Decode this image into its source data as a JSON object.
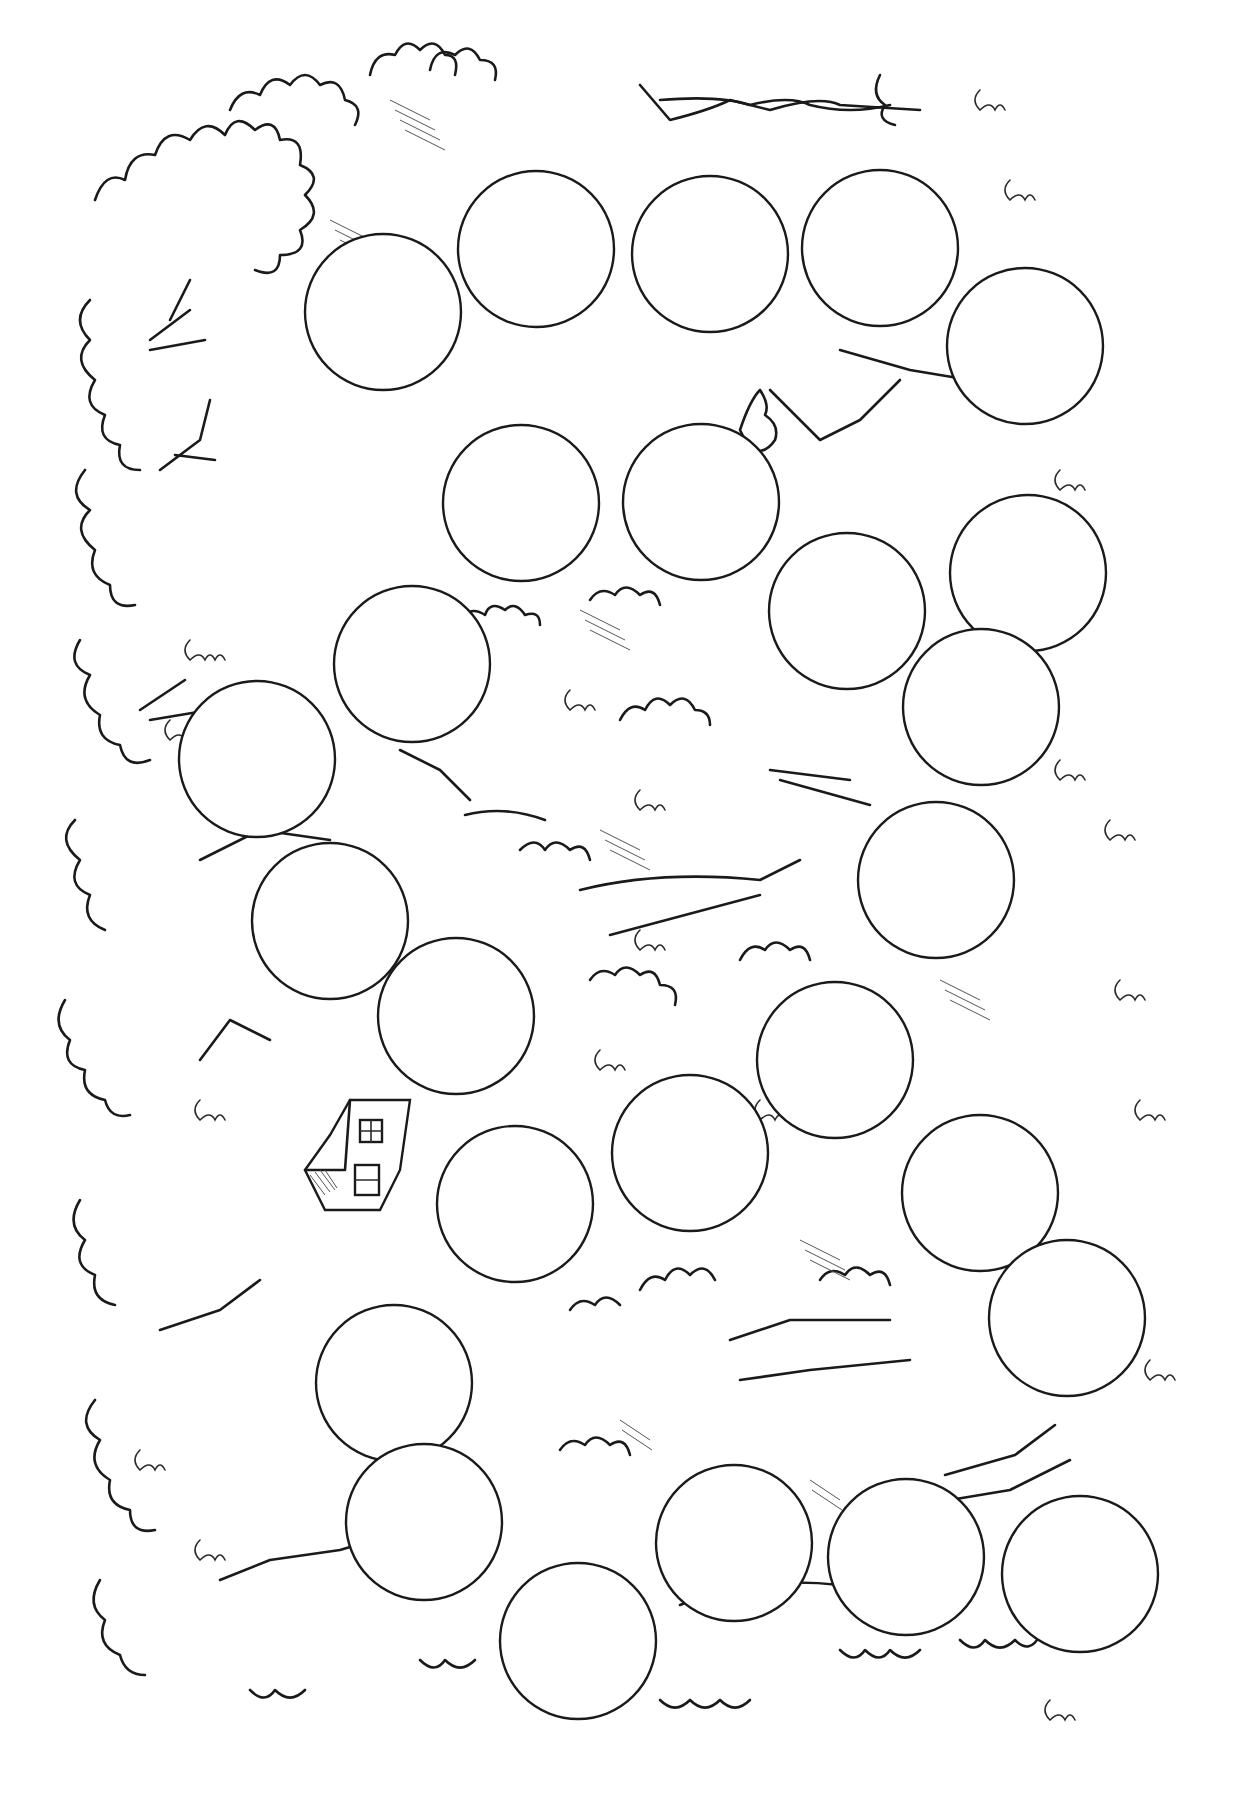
{
  "page": {
    "type": "board-game-coloring-page",
    "scene": "forest",
    "background_color": "#ffffff",
    "ink_color": "#1a1a1a"
  },
  "board": {
    "space_count": 26,
    "space_radius": 78,
    "spaces": [
      {
        "id": 1,
        "cx": 383,
        "cy": 312
      },
      {
        "id": 2,
        "cx": 536,
        "cy": 249
      },
      {
        "id": 3,
        "cx": 710,
        "cy": 254
      },
      {
        "id": 4,
        "cx": 880,
        "cy": 248
      },
      {
        "id": 5,
        "cx": 1025,
        "cy": 346
      },
      {
        "id": 6,
        "cx": 521,
        "cy": 503
      },
      {
        "id": 7,
        "cx": 701,
        "cy": 502
      },
      {
        "id": 8,
        "cx": 847,
        "cy": 611
      },
      {
        "id": 9,
        "cx": 1028,
        "cy": 573
      },
      {
        "id": 10,
        "cx": 412,
        "cy": 664
      },
      {
        "id": 11,
        "cx": 257,
        "cy": 759
      },
      {
        "id": 12,
        "cx": 981,
        "cy": 707
      },
      {
        "id": 13,
        "cx": 330,
        "cy": 921
      },
      {
        "id": 14,
        "cx": 936,
        "cy": 880
      },
      {
        "id": 15,
        "cx": 456,
        "cy": 1016
      },
      {
        "id": 16,
        "cx": 835,
        "cy": 1060
      },
      {
        "id": 17,
        "cx": 690,
        "cy": 1153
      },
      {
        "id": 18,
        "cx": 980,
        "cy": 1193
      },
      {
        "id": 19,
        "cx": 515,
        "cy": 1204
      },
      {
        "id": 20,
        "cx": 394,
        "cy": 1383
      },
      {
        "id": 21,
        "cx": 1067,
        "cy": 1318
      },
      {
        "id": 22,
        "cx": 424,
        "cy": 1522
      },
      {
        "id": 23,
        "cx": 734,
        "cy": 1543
      },
      {
        "id": 24,
        "cx": 906,
        "cy": 1557
      },
      {
        "id": 25,
        "cx": 1080,
        "cy": 1574
      },
      {
        "id": 26,
        "cx": 578,
        "cy": 1641
      }
    ]
  },
  "decorations": {
    "house": {
      "x": 305,
      "y": 1100,
      "label": "cabin"
    },
    "squirrel": {
      "x": 740,
      "y": 420
    }
  }
}
